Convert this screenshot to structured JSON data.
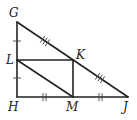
{
  "diagram": {
    "type": "geometry",
    "points": {
      "G": {
        "label": "G",
        "x": 17,
        "y": 22
      },
      "L": {
        "label": "L",
        "x": 17,
        "y": 60
      },
      "H": {
        "label": "H",
        "x": 17,
        "y": 97
      },
      "K": {
        "label": "K",
        "x": 73,
        "y": 60
      },
      "M": {
        "label": "M",
        "x": 73,
        "y": 97
      },
      "J": {
        "label": "J",
        "x": 128,
        "y": 97
      }
    },
    "segments": [
      "GH",
      "HJ",
      "GJ",
      "LK",
      "KM",
      "LM"
    ],
    "congruence_marks": [
      {
        "segments": [
          "GL",
          "LH"
        ],
        "ticks": 1
      },
      {
        "segments": [
          "HM",
          "MJ"
        ],
        "ticks": 2
      },
      {
        "segments": [
          "GK",
          "KJ"
        ],
        "ticks": 3
      }
    ],
    "colors": {
      "stroke": "#222222",
      "background": "#ffffff"
    }
  }
}
